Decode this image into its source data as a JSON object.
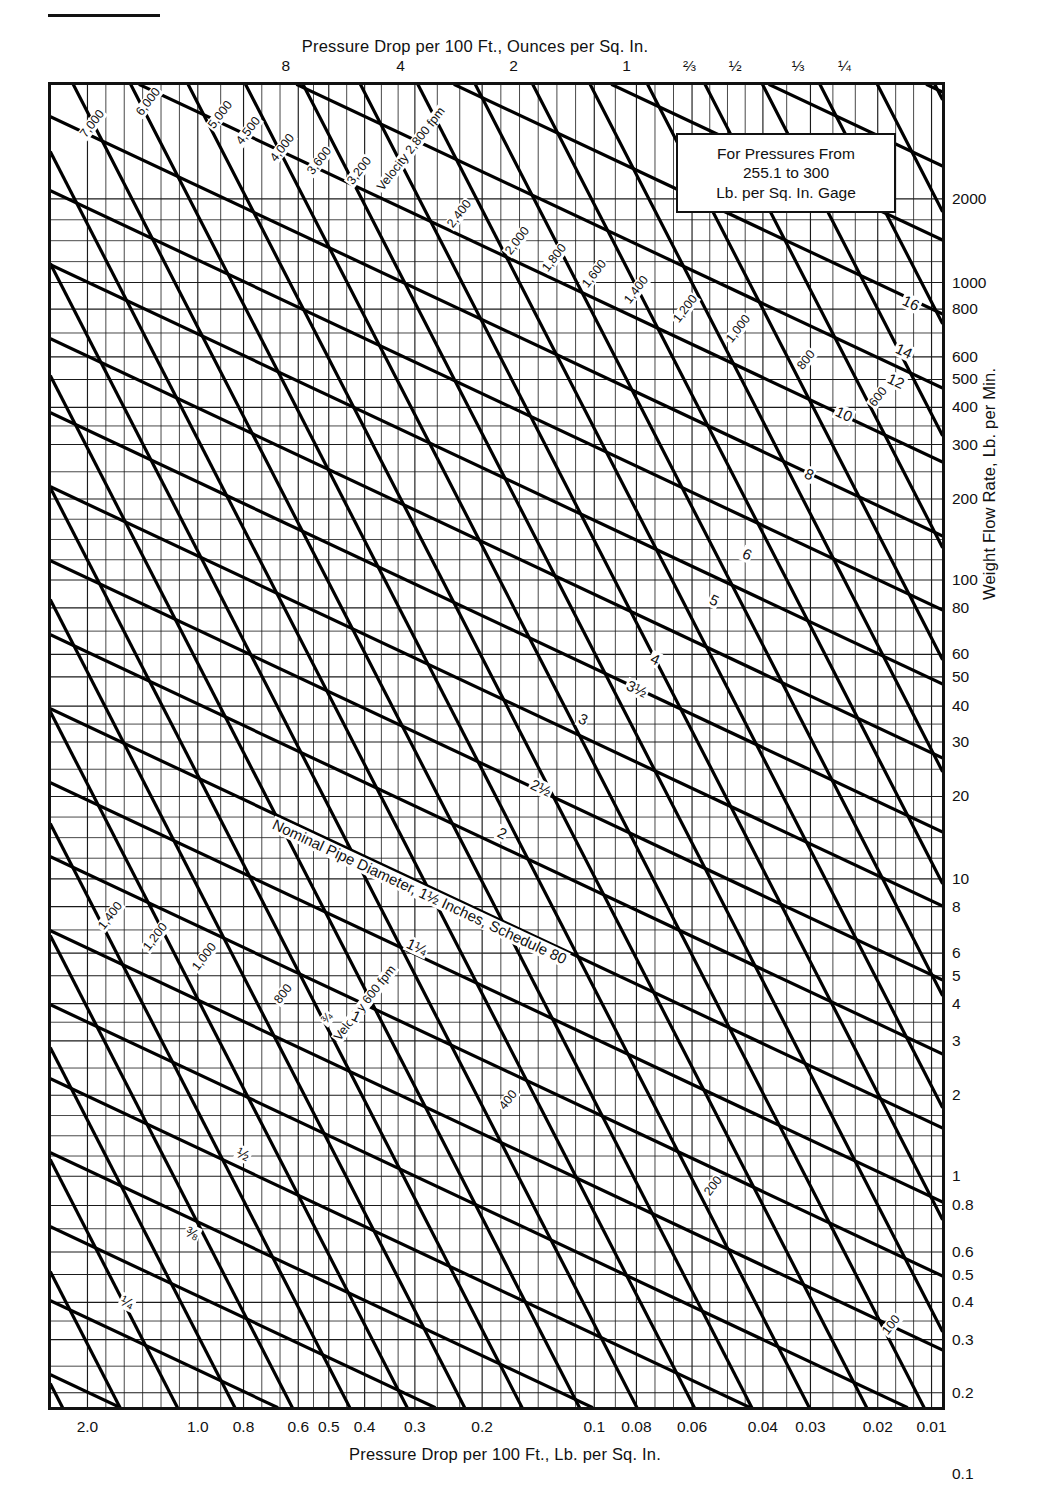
{
  "titles": {
    "top_axis": "Pressure Drop per 100 Ft., Ounces per Sq. In.",
    "bottom_axis": "Pressure Drop per 100 Ft., Lb. per Sq. In.",
    "right_axis": "Weight Flow Rate, Lb. per Min."
  },
  "callout": {
    "line1": "For Pressures From",
    "line2": "255.1 to 300",
    "line3": "Lb. per Sq. In. Gage"
  },
  "chart_data": {
    "type": "line",
    "xlabel": "Pressure Drop per 100 Ft., Lb. per Sq. In.",
    "ylabel": "Weight Flow Rate, Lb. per Min.",
    "top_xlabel": "Pressure Drop per 100 Ft., Ounces per Sq. In.",
    "xscale": "log-reversed",
    "yscale": "log",
    "xlim": [
      2.0,
      0.01
    ],
    "ylim": [
      0.1,
      3000
    ],
    "grid": true,
    "legend": "none",
    "x_ticks": [
      "2.0",
      "1.0",
      "0.8",
      "0.6",
      "0.5",
      "0.4",
      "0.3",
      "0.2",
      "0.1",
      "0.08",
      "0.06",
      "0.04",
      "0.03",
      "0.02",
      "0.01"
    ],
    "x_tick_values": [
      2.0,
      1.0,
      0.8,
      0.6,
      0.5,
      0.4,
      0.3,
      0.2,
      0.1,
      0.08,
      0.06,
      0.04,
      0.03,
      0.02,
      0.01
    ],
    "top_x_ticks": [
      "8",
      "4",
      "2",
      "1",
      "⅔",
      "½",
      "⅓",
      "¼"
    ],
    "top_x_tick_values": [
      8,
      4,
      2,
      1,
      0.6667,
      0.5,
      0.3333,
      0.25
    ],
    "y_ticks": [
      "2000",
      "1000",
      "800",
      "600",
      "500",
      "400",
      "300",
      "200",
      "100",
      "80",
      "60",
      "50",
      "40",
      "30",
      "20",
      "10",
      "8",
      "6",
      "5",
      "4",
      "3",
      "2",
      "1",
      "0.8",
      "0.6",
      "0.5",
      "0.4",
      "0.3",
      "0.2",
      "0.1"
    ],
    "y_tick_values": [
      2000,
      1000,
      800,
      600,
      500,
      400,
      300,
      200,
      100,
      80,
      60,
      50,
      40,
      30,
      20,
      10,
      8,
      6,
      5,
      4,
      3,
      2,
      1,
      0.8,
      0.6,
      0.5,
      0.4,
      0.3,
      0.2,
      0.1
    ],
    "series": [
      {
        "name": "velocity-lines",
        "label": "Velocity, fpm",
        "direction": "up-right",
        "values": [
          "7,000",
          "6,000",
          "5,000",
          "4,500",
          "4,000",
          "3,600",
          "3,200",
          "2,800",
          "2,400",
          "2,000",
          "1,800",
          "1,600",
          "1,400",
          "1,200",
          "1,000",
          "800",
          "600",
          "400",
          "200",
          "100"
        ]
      },
      {
        "name": "pipe-diameter-lines",
        "label": "Nominal Pipe Diameter, Inches, Schedule 80",
        "direction": "down-right",
        "values": [
          "16",
          "14",
          "12",
          "10",
          "8",
          "6",
          "5",
          "4",
          "3½",
          "3",
          "2½",
          "2",
          "1½",
          "1¼",
          "1",
          "¾",
          "½",
          "⅜",
          "¼"
        ]
      }
    ],
    "annotations": [
      "Velocity 2,800 fpm",
      "Velocity 600 fpm",
      "Nominal Pipe Diameter, 1½ Inches, Schedule 80",
      "For Pressures From 255.1 to 300 Lb. per Sq. In. Gage"
    ]
  },
  "axes": {
    "top_ticks": [
      {
        "label": "8",
        "x": 0.265
      },
      {
        "label": "4",
        "x": 0.393
      },
      {
        "label": "2",
        "x": 0.519
      },
      {
        "label": "1",
        "x": 0.645
      },
      {
        "label": "⅔",
        "x": 0.715
      },
      {
        "label": "½",
        "x": 0.766
      },
      {
        "label": "⅓",
        "x": 0.836
      },
      {
        "label": "¼",
        "x": 0.888
      }
    ],
    "bottom_ticks": [
      {
        "label": "2.0",
        "x": 0.044
      },
      {
        "label": "1.0",
        "x": 0.167
      },
      {
        "label": "0.8",
        "x": 0.218
      },
      {
        "label": "0.6",
        "x": 0.279
      },
      {
        "label": "0.5",
        "x": 0.313
      },
      {
        "label": "0.4",
        "x": 0.353
      },
      {
        "label": "0.3",
        "x": 0.409
      },
      {
        "label": "0.2",
        "x": 0.484
      },
      {
        "label": "0.1",
        "x": 0.609
      },
      {
        "label": "0.08",
        "x": 0.656
      },
      {
        "label": "0.06",
        "x": 0.718
      },
      {
        "label": "0.04",
        "x": 0.797
      },
      {
        "label": "0.03",
        "x": 0.85
      },
      {
        "label": "0.02",
        "x": 0.925
      },
      {
        "label": "0.01",
        "x": 0.985
      }
    ],
    "right_ticks": [
      {
        "label": "2000",
        "y": 0.088
      },
      {
        "label": "1000",
        "y": 0.151
      },
      {
        "label": "800",
        "y": 0.171
      },
      {
        "label": "600",
        "y": 0.207
      },
      {
        "label": "500",
        "y": 0.224
      },
      {
        "label": "400",
        "y": 0.245
      },
      {
        "label": "300",
        "y": 0.273
      },
      {
        "label": "200",
        "y": 0.314
      },
      {
        "label": "100",
        "y": 0.375
      },
      {
        "label": "80",
        "y": 0.396
      },
      {
        "label": "60",
        "y": 0.431
      },
      {
        "label": "50",
        "y": 0.448
      },
      {
        "label": "40",
        "y": 0.47
      },
      {
        "label": "30",
        "y": 0.497
      },
      {
        "label": "20",
        "y": 0.538
      },
      {
        "label": "10",
        "y": 0.6
      },
      {
        "label": "8",
        "y": 0.621
      },
      {
        "label": "6",
        "y": 0.656
      },
      {
        "label": "5",
        "y": 0.673
      },
      {
        "label": "4",
        "y": 0.694
      },
      {
        "label": "3",
        "y": 0.722
      },
      {
        "label": "2",
        "y": 0.763
      },
      {
        "label": "1",
        "y": 0.824
      },
      {
        "label": "0.8",
        "y": 0.846
      },
      {
        "label": "0.6",
        "y": 0.881
      },
      {
        "label": "0.5",
        "y": 0.898
      },
      {
        "label": "0.4",
        "y": 0.919
      },
      {
        "label": "0.3",
        "y": 0.947
      },
      {
        "label": "0.2",
        "y": 0.987
      },
      {
        "label": "0.1",
        "y": 1.048
      }
    ]
  },
  "velocity_labels": [
    {
      "text": "7,000",
      "x": 0.035,
      "y": 0.035,
      "rot": -52
    },
    {
      "text": "6,000",
      "x": 0.098,
      "y": 0.018,
      "rot": -52
    },
    {
      "text": "5,000",
      "x": 0.178,
      "y": 0.028,
      "rot": -52
    },
    {
      "text": "4,500",
      "x": 0.21,
      "y": 0.04,
      "rot": -52
    },
    {
      "text": "4,000",
      "x": 0.248,
      "y": 0.053,
      "rot": -52
    },
    {
      "text": "3,600",
      "x": 0.29,
      "y": 0.063,
      "rot": -52
    },
    {
      "text": "3,200",
      "x": 0.335,
      "y": 0.07,
      "rot": -52
    },
    {
      "text": "Velocity 2,800 fpm",
      "x": 0.368,
      "y": 0.075,
      "rot": -52
    },
    {
      "text": "2,400",
      "x": 0.447,
      "y": 0.103,
      "rot": -52
    },
    {
      "text": "2,000",
      "x": 0.512,
      "y": 0.123,
      "rot": -52
    },
    {
      "text": "1,800",
      "x": 0.553,
      "y": 0.136,
      "rot": -52
    },
    {
      "text": "1,600",
      "x": 0.598,
      "y": 0.148,
      "rot": -52
    },
    {
      "text": "1,400",
      "x": 0.645,
      "y": 0.16,
      "rot": -52
    },
    {
      "text": "1,200",
      "x": 0.7,
      "y": 0.175,
      "rot": -52
    },
    {
      "text": "1,000",
      "x": 0.76,
      "y": 0.19,
      "rot": -52
    },
    {
      "text": "800",
      "x": 0.84,
      "y": 0.21,
      "rot": -52
    },
    {
      "text": "600",
      "x": 0.92,
      "y": 0.238,
      "rot": -52
    },
    {
      "text": "1,400",
      "x": 0.055,
      "y": 0.634,
      "rot": -52
    },
    {
      "text": "1,200",
      "x": 0.105,
      "y": 0.65,
      "rot": -52
    },
    {
      "text": "1,000",
      "x": 0.16,
      "y": 0.665,
      "rot": -52
    },
    {
      "text": "800",
      "x": 0.253,
      "y": 0.69,
      "rot": -52
    },
    {
      "text": "¾",
      "x": 0.305,
      "y": 0.705,
      "rot": -50
    },
    {
      "text": "Velocity 600 fpm",
      "x": 0.32,
      "y": 0.718,
      "rot": -52
    },
    {
      "text": "400",
      "x": 0.505,
      "y": 0.77,
      "rot": -52
    },
    {
      "text": "200",
      "x": 0.735,
      "y": 0.835,
      "rot": -52
    },
    {
      "text": "100",
      "x": 0.935,
      "y": 0.94,
      "rot": -52
    }
  ],
  "pipe_labels": [
    {
      "text": "16",
      "x": 0.955,
      "y": 0.156,
      "rot": 25
    },
    {
      "text": "14",
      "x": 0.947,
      "y": 0.192,
      "rot": 25
    },
    {
      "text": "12",
      "x": 0.938,
      "y": 0.215,
      "rot": 25
    },
    {
      "text": "10",
      "x": 0.88,
      "y": 0.24,
      "rot": 25
    },
    {
      "text": "8",
      "x": 0.845,
      "y": 0.287,
      "rot": 25
    },
    {
      "text": "6",
      "x": 0.775,
      "y": 0.347,
      "rot": 25
    },
    {
      "text": "5",
      "x": 0.738,
      "y": 0.382,
      "rot": 25
    },
    {
      "text": "4",
      "x": 0.672,
      "y": 0.427,
      "rot": 25
    },
    {
      "text": "3½",
      "x": 0.645,
      "y": 0.447,
      "rot": 25
    },
    {
      "text": "3",
      "x": 0.592,
      "y": 0.472,
      "rot": 25
    },
    {
      "text": "2½",
      "x": 0.538,
      "y": 0.522,
      "rot": 25
    },
    {
      "text": "2",
      "x": 0.5,
      "y": 0.558,
      "rot": 25
    },
    {
      "text": "Nominal Pipe Diameter, 1½ Inches, Schedule 80",
      "x": 0.248,
      "y": 0.552,
      "rot": 25
    },
    {
      "text": "1¼",
      "x": 0.398,
      "y": 0.642,
      "rot": 25
    },
    {
      "text": "1",
      "x": 0.337,
      "y": 0.697,
      "rot": 25
    },
    {
      "text": "½",
      "x": 0.208,
      "y": 0.8,
      "rot": 25
    },
    {
      "text": "⅜",
      "x": 0.15,
      "y": 0.86,
      "rot": 25
    },
    {
      "text": "¼",
      "x": 0.078,
      "y": 0.912,
      "rot": 25
    }
  ]
}
